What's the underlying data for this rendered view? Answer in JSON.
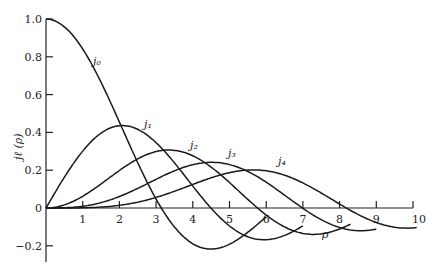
{
  "chart_data": {
    "type": "line",
    "title": "",
    "xlabel": "ρ",
    "ylabel": "j_ℓ(ρ)",
    "xlim": [
      0,
      10
    ],
    "ylim": [
      -0.3,
      1.0
    ],
    "grid": false,
    "legend": "inline curve labels",
    "x_ticks": [
      1,
      2,
      3,
      4,
      5,
      6,
      7,
      8,
      9,
      10
    ],
    "x_tick_labels": [
      "1",
      "2",
      "3",
      "4",
      "5",
      "6",
      "7",
      "8",
      "9",
      "10"
    ],
    "y_ticks": [
      -0.2,
      0,
      0.2,
      0.4,
      0.6,
      0.8,
      1.0
    ],
    "y_tick_labels": [
      "−0.2",
      "0",
      "0.2",
      "0.4",
      "0.6",
      "0.8",
      "1.0"
    ],
    "series": [
      {
        "name": "j0",
        "label": "j₀",
        "x_range": [
          0,
          6.0
        ],
        "peak": {
          "x": 0,
          "y": 1.0
        },
        "min": {
          "x": 4.49,
          "y": -0.217
        }
      },
      {
        "name": "j1",
        "label": "j₁",
        "x_range": [
          0,
          7.0
        ],
        "peak": {
          "x": 2.08,
          "y": 0.436
        },
        "min": {
          "x": 5.76,
          "y": -0.16
        }
      },
      {
        "name": "j2",
        "label": "j₂",
        "x_range": [
          0,
          8.3
        ],
        "peak": {
          "x": 3.34,
          "y": 0.307
        }
      },
      {
        "name": "j3",
        "label": "j₃",
        "x_range": [
          0,
          9.0
        ],
        "peak": {
          "x": 4.51,
          "y": 0.243
        }
      },
      {
        "name": "j4",
        "label": "j₄",
        "x_range": [
          0,
          10.1
        ],
        "peak": {
          "x": 5.65,
          "y": 0.203
        }
      }
    ]
  },
  "labels": {
    "x_axis": "ρ",
    "y_axis": "jℓ (ρ)",
    "j0": "j₀",
    "j1": "j₁",
    "j2": "j₂",
    "j3": "j₃",
    "j4": "j₄"
  }
}
